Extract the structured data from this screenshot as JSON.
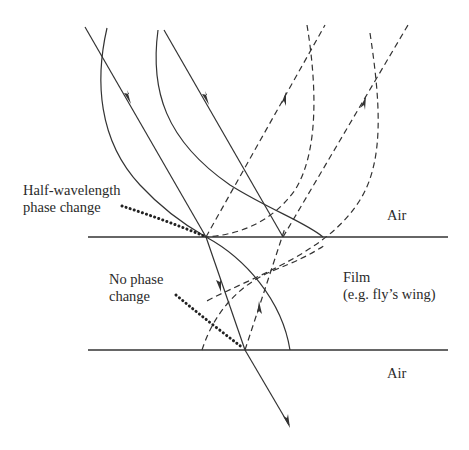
{
  "diagram": {
    "labels": {
      "half_wavelength_line1": "Half-wavelength",
      "half_wavelength_line2": "phase change",
      "no_phase_line1": "No phase",
      "no_phase_line2": "change",
      "air_top": "Air",
      "film_line1": "Film",
      "film_line2": "(e.g. fly’s wing)",
      "air_bottom": "Air"
    },
    "regions": [
      "Air",
      "Film (e.g. fly’s wing)",
      "Air"
    ],
    "elements": {
      "incident_rays": 2,
      "incident_wavefronts": 2,
      "reflected_rays_dashed": 2,
      "reflected_wavefronts_dashed": 2,
      "transmitted_ray": 1
    },
    "colors": {
      "line": "#333333",
      "text": "#2a2a2a",
      "background": "#ffffff"
    }
  }
}
